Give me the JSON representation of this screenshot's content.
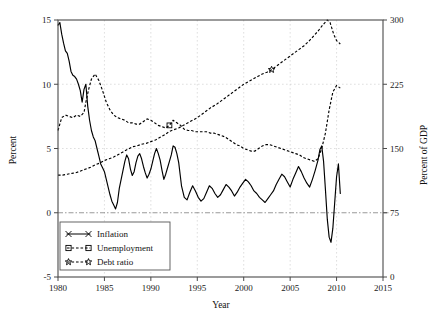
{
  "chart_data": {
    "type": "line",
    "title": "",
    "xlabel": "Year",
    "ylabel": "Percent",
    "y2label": "Percent of GDP",
    "xlim": [
      1980,
      2015
    ],
    "ylim": [
      -5,
      15
    ],
    "y2lim": [
      0,
      300
    ],
    "xticks": [
      "1980",
      "1985",
      "1990",
      "1995",
      "2000",
      "2005",
      "2010",
      "2015"
    ],
    "xtick_values": [
      1980,
      1985,
      1990,
      1995,
      2000,
      2005,
      2010,
      2015
    ],
    "yticks": [
      "-5",
      "0",
      "5",
      "10",
      "15"
    ],
    "ytick_values": [
      -5,
      0,
      5,
      10,
      15
    ],
    "y2ticks": [
      "0",
      "75",
      "150",
      "225",
      "300"
    ],
    "y2tick_values": [
      0,
      75,
      150,
      225,
      300
    ],
    "grid": true,
    "zero_reference_line": 0,
    "legend_position": "lower-left",
    "series": [
      {
        "name": "Inflation",
        "axis": "left",
        "style": "solid",
        "marker": "x",
        "x": [
          1980.0,
          1980.2,
          1980.4,
          1980.6,
          1980.8,
          1981.0,
          1981.2,
          1981.4,
          1981.6,
          1981.8,
          1982.0,
          1982.2,
          1982.4,
          1982.6,
          1982.8,
          1983.0,
          1983.2,
          1983.4,
          1983.6,
          1983.8,
          1984.0,
          1984.2,
          1984.4,
          1984.6,
          1984.8,
          1985.0,
          1985.2,
          1985.4,
          1985.6,
          1985.8,
          1986.0,
          1986.2,
          1986.4,
          1986.6,
          1986.8,
          1987.0,
          1987.2,
          1987.4,
          1987.6,
          1987.8,
          1988.0,
          1988.2,
          1988.4,
          1988.6,
          1988.8,
          1989.0,
          1989.2,
          1989.4,
          1989.6,
          1989.8,
          1990.0,
          1990.2,
          1990.4,
          1990.6,
          1990.8,
          1991.0,
          1991.2,
          1991.4,
          1991.6,
          1991.8,
          1992.0,
          1992.2,
          1992.4,
          1992.6,
          1992.8,
          1993.0,
          1993.3,
          1993.6,
          1993.9,
          1994.2,
          1994.5,
          1994.8,
          1995.1,
          1995.4,
          1995.7,
          1996.0,
          1996.3,
          1996.6,
          1996.9,
          1997.2,
          1997.5,
          1997.8,
          1998.1,
          1998.4,
          1998.7,
          1999.0,
          1999.3,
          1999.6,
          1999.9,
          2000.2,
          2000.5,
          2000.8,
          2001.1,
          2001.4,
          2001.7,
          2002.0,
          2002.3,
          2002.6,
          2002.9,
          2003.2,
          2003.5,
          2003.8,
          2004.1,
          2004.4,
          2004.7,
          2005.0,
          2005.3,
          2005.6,
          2005.9,
          2006.2,
          2006.5,
          2006.8,
          2007.1,
          2007.4,
          2007.7,
          2008.0,
          2008.2,
          2008.4,
          2008.6,
          2008.8,
          2009.0,
          2009.2,
          2009.4,
          2009.6,
          2009.8,
          2010.0,
          2010.2,
          2010.4
        ],
        "y": [
          14.6,
          14.8,
          13.9,
          13.2,
          12.6,
          12.4,
          11.8,
          11.0,
          10.7,
          10.6,
          10.4,
          10.0,
          9.5,
          8.6,
          9.6,
          10.0,
          8.3,
          7.2,
          6.4,
          5.9,
          5.6,
          5.0,
          4.4,
          3.8,
          3.5,
          3.2,
          2.6,
          2.0,
          1.4,
          0.9,
          0.6,
          0.3,
          0.8,
          1.9,
          2.6,
          3.3,
          4.0,
          4.5,
          4.2,
          3.4,
          2.9,
          3.2,
          3.9,
          4.4,
          4.6,
          4.2,
          3.6,
          3.1,
          2.7,
          3.0,
          3.4,
          4.0,
          4.6,
          5.0,
          4.6,
          4.1,
          3.3,
          2.6,
          3.0,
          3.5,
          4.0,
          4.5,
          5.2,
          5.1,
          4.6,
          3.9,
          2.1,
          1.2,
          1.0,
          1.6,
          2.1,
          1.7,
          1.2,
          0.9,
          1.1,
          1.6,
          2.1,
          1.9,
          1.5,
          1.2,
          1.4,
          1.8,
          2.2,
          2.0,
          1.7,
          1.3,
          1.6,
          2.0,
          2.3,
          2.6,
          2.4,
          2.1,
          1.7,
          1.5,
          1.2,
          1.0,
          0.8,
          1.1,
          1.4,
          1.7,
          2.2,
          2.6,
          3.0,
          2.8,
          2.4,
          2.0,
          2.6,
          3.1,
          3.6,
          3.2,
          2.7,
          2.3,
          2.0,
          2.6,
          3.3,
          4.1,
          4.9,
          5.2,
          4.0,
          1.8,
          -0.5,
          -1.9,
          -2.3,
          -1.2,
          0.8,
          2.8,
          3.8,
          1.5
        ]
      },
      {
        "name": "Unemployment",
        "axis": "left",
        "style": "dashed",
        "marker": "square",
        "x": [
          1980.0,
          1980.4,
          1980.8,
          1981.2,
          1981.6,
          1982.0,
          1982.4,
          1982.8,
          1983.0,
          1983.3,
          1983.6,
          1984.0,
          1984.4,
          1984.8,
          1985.2,
          1985.6,
          1986.0,
          1986.4,
          1986.8,
          1987.2,
          1987.6,
          1988.0,
          1988.4,
          1988.8,
          1989.2,
          1989.6,
          1990.0,
          1990.4,
          1990.8,
          1991.2,
          1991.6,
          1992.0,
          1992.4,
          1992.8,
          1993.2,
          1993.6,
          1994.0,
          1994.4,
          1994.8,
          1995.2,
          1995.6,
          1996.0,
          1996.4,
          1996.8,
          1997.2,
          1997.6,
          1998.0,
          1998.4,
          1998.8,
          1999.2,
          1999.6,
          2000.0,
          2000.4,
          2000.8,
          2001.2,
          2001.6,
          2002.0,
          2002.4,
          2002.8,
          2003.2,
          2003.6,
          2004.0,
          2004.4,
          2004.8,
          2005.2,
          2005.6,
          2006.0,
          2006.4,
          2006.8,
          2007.2,
          2007.6,
          2008.0,
          2008.4,
          2008.8,
          2009.2,
          2009.6,
          2010.0,
          2010.4
        ],
        "y": [
          6.4,
          7.4,
          7.6,
          7.5,
          7.4,
          7.6,
          7.5,
          7.8,
          8.6,
          9.6,
          10.4,
          10.8,
          10.3,
          9.5,
          8.6,
          8.0,
          7.6,
          7.4,
          7.3,
          7.2,
          7.0,
          7.0,
          6.9,
          6.9,
          7.1,
          7.3,
          7.2,
          7.0,
          6.8,
          6.7,
          6.6,
          6.8,
          7.2,
          7.0,
          6.8,
          6.5,
          6.4,
          6.4,
          6.3,
          6.3,
          6.3,
          6.3,
          6.2,
          6.2,
          6.1,
          6.0,
          5.9,
          5.7,
          5.5,
          5.3,
          5.2,
          5.0,
          4.9,
          4.8,
          4.8,
          5.0,
          5.2,
          5.3,
          5.3,
          5.2,
          5.1,
          5.0,
          4.9,
          4.8,
          4.7,
          4.6,
          4.5,
          4.3,
          4.2,
          4.1,
          4.0,
          4.2,
          5.0,
          6.2,
          8.0,
          9.4,
          9.9,
          9.7
        ]
      },
      {
        "name": "Debt ratio",
        "axis": "right",
        "style": "dashed",
        "marker": "star",
        "x": [
          1980.0,
          1980.5,
          1981.0,
          1981.5,
          1982.0,
          1982.5,
          1983.0,
          1983.5,
          1984.0,
          1984.5,
          1985.0,
          1985.5,
          1986.0,
          1986.5,
          1987.0,
          1987.5,
          1988.0,
          1988.5,
          1989.0,
          1989.5,
          1990.0,
          1990.5,
          1991.0,
          1991.5,
          1992.0,
          1992.5,
          1993.0,
          1993.5,
          1994.0,
          1994.5,
          1995.0,
          1995.5,
          1996.0,
          1996.5,
          1997.0,
          1997.5,
          1998.0,
          1998.5,
          1999.0,
          1999.5,
          2000.0,
          2000.5,
          2001.0,
          2001.5,
          2002.0,
          2002.5,
          2003.0,
          2003.5,
          2004.0,
          2004.5,
          2005.0,
          2005.5,
          2006.0,
          2006.5,
          2007.0,
          2007.5,
          2008.0,
          2008.5,
          2009.0,
          2009.3,
          2009.7,
          2010.0,
          2010.4
        ],
        "y": [
          119,
          119,
          120,
          121,
          122,
          124,
          126,
          128,
          131,
          133,
          136,
          138,
          140,
          143,
          146,
          149,
          152,
          153,
          155,
          156,
          158,
          160,
          163,
          166,
          170,
          172,
          174,
          177,
          180,
          183,
          186,
          190,
          194,
          198,
          201,
          205,
          209,
          213,
          217,
          221,
          225,
          228,
          231,
          234,
          237,
          239,
          242,
          246,
          250,
          254,
          258,
          262,
          266,
          270,
          275,
          281,
          287,
          294,
          300,
          297,
          283,
          276,
          272
        ]
      }
    ],
    "legend_markers": {
      "inflation": "x",
      "unemployment": "square",
      "debt_ratio": "star"
    }
  },
  "axes": {
    "left_title": "Percent",
    "right_title": "Percent of GDP",
    "bottom_title": "Year"
  }
}
